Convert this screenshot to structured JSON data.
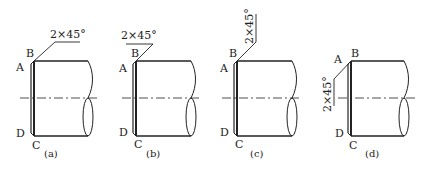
{
  "figure": {
    "panels": [
      {
        "id": "a",
        "caption": "(a)",
        "dimension": "2×45°",
        "points": {
          "A": "A",
          "B": "B",
          "C": "C",
          "D": "D"
        },
        "ox": 0
      },
      {
        "id": "b",
        "caption": "(b)",
        "dimension": "2×45°",
        "points": {
          "A": "A",
          "B": "B",
          "C": "C",
          "D": "D"
        },
        "ox": 0
      },
      {
        "id": "c",
        "caption": "(c)",
        "dimension": "2×45°",
        "points": {
          "A": "A",
          "B": "B",
          "C": "C",
          "D": "D"
        },
        "ox": 0
      },
      {
        "id": "d",
        "caption": "(d)",
        "dimension": "2×45°",
        "points": {
          "A": "A",
          "B": "B",
          "C": "C",
          "D": "D"
        },
        "ox": 0
      }
    ],
    "colors": {
      "line": "#222222",
      "background": "#ffffff"
    }
  }
}
